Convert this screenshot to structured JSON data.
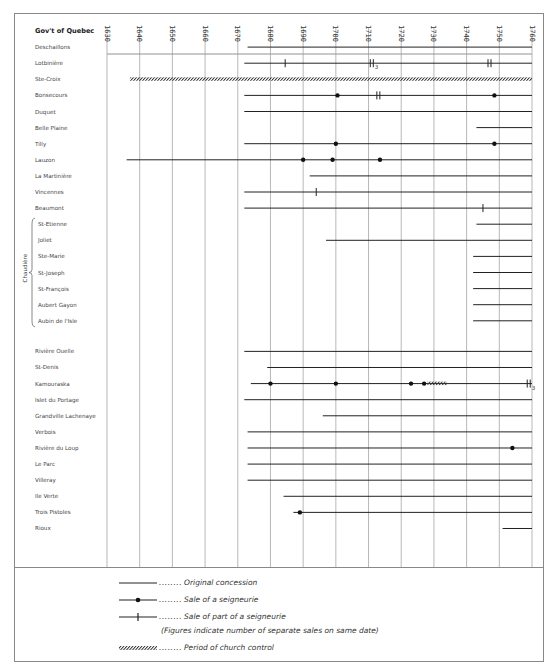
{
  "chart_data": {
    "type": "timeline",
    "title": "",
    "x_axis": {
      "min": 1630,
      "max": 1760,
      "step": 10,
      "ticks": [
        "1630",
        "1640",
        "1650",
        "1660",
        "1670",
        "1680",
        "1690",
        "1700",
        "1710",
        "1720",
        "1730",
        "1740",
        "1750",
        "1760"
      ]
    },
    "group_label": "Chaudière",
    "rows": [
      {
        "name": "Gov't of Quebec",
        "header": true
      },
      {
        "name": "Deschaillons",
        "start": 1673
      },
      {
        "name": "Lotbinière",
        "start": 1672,
        "part_sales": [
          {
            "year": 1684.5
          },
          {
            "year": 1711,
            "count": 3
          },
          {
            "year": 1747,
            "count": 2
          }
        ]
      },
      {
        "name": "Ste-Croix",
        "church_control": [
          1637,
          1760
        ]
      },
      {
        "name": "Bonsecours",
        "start": 1672,
        "sales": [
          1700.5,
          1748.5
        ],
        "part_sales": [
          {
            "year": 1713,
            "count": 2
          }
        ]
      },
      {
        "name": "Duquet",
        "start": 1672
      },
      {
        "name": "Belle Plaine",
        "start": 1743
      },
      {
        "name": "Tilly",
        "start": 1672,
        "sales": [
          1700,
          1748.5
        ]
      },
      {
        "name": "Lauzon",
        "start": 1636,
        "sales": [
          1690,
          1699,
          1713.5
        ]
      },
      {
        "name": "La Martinière",
        "start": 1692
      },
      {
        "name": "Vincennes",
        "start": 1672,
        "part_sales": [
          {
            "year": 1694
          }
        ]
      },
      {
        "name": "Beaumont",
        "start": 1672,
        "part_sales": [
          {
            "year": 1745
          }
        ]
      },
      {
        "name": "St-Etienne",
        "start": 1743,
        "group": "Chaudière"
      },
      {
        "name": "Joliet",
        "start": 1697,
        "group": "Chaudière"
      },
      {
        "name": "Ste-Marie",
        "start": 1742,
        "group": "Chaudière"
      },
      {
        "name": "St-Joseph",
        "start": 1742,
        "group": "Chaudière"
      },
      {
        "name": "St-François",
        "start": 1742,
        "group": "Chaudière"
      },
      {
        "name": "Aubert Gayon",
        "start": 1742,
        "group": "Chaudière"
      },
      {
        "name": "Aubin de l'Isle",
        "start": 1742,
        "group": "Chaudière"
      },
      {
        "name": "",
        "spacer": true
      },
      {
        "name": "Rivière Ouelle",
        "start": 1672
      },
      {
        "name": "St-Denis",
        "start": 1679
      },
      {
        "name": "Kamouraska",
        "start": 1674,
        "sales": [
          1680,
          1700,
          1723,
          1727
        ],
        "church_control": [
          1728,
          1734
        ],
        "part_sales": [
          {
            "year": 1759,
            "count": 3
          }
        ]
      },
      {
        "name": "Islet du Portage",
        "start": 1672
      },
      {
        "name": "Grandville Lachenaye",
        "start": 1696
      },
      {
        "name": "Verbois",
        "start": 1673
      },
      {
        "name": "Rivière du Loup",
        "start": 1673,
        "sales": [
          1754
        ]
      },
      {
        "name": "Le Parc",
        "start": 1673
      },
      {
        "name": "Villeray",
        "start": 1673
      },
      {
        "name": "Ile Verte",
        "start": 1684
      },
      {
        "name": "Trois Pistoles",
        "start": 1687,
        "sales": [
          1689
        ]
      },
      {
        "name": "Rioux",
        "start": 1751
      }
    ]
  },
  "legend": {
    "original": "Original concession",
    "sale": "Sale of a seigneurie",
    "part": "Sale of part of a seigneurie",
    "note": "(Figures indicate number of separate sales on same date)",
    "church": "Period of church control",
    "dots": "........"
  },
  "colors": {
    "line": "#222222",
    "grid": "#999999",
    "text": "#444444"
  }
}
